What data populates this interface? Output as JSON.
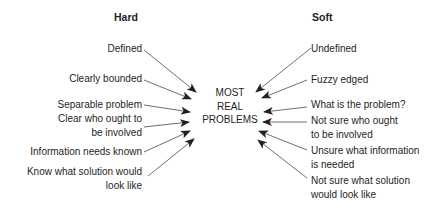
{
  "diagram": {
    "left_heading": "Hard",
    "right_heading": "Soft",
    "center": [
      "MOST",
      "REAL",
      "PROBLEMS"
    ],
    "left_items": [
      [
        "Defined"
      ],
      [
        "Clearly bounded"
      ],
      [
        "Separable problem"
      ],
      [
        "Clear who ought to",
        "be involved"
      ],
      [
        "Information needs known"
      ],
      [
        "Know what solution would",
        "look like"
      ]
    ],
    "right_items": [
      [
        "Undefined"
      ],
      [
        "Fuzzy edged"
      ],
      [
        "What is the problem?"
      ],
      [
        "Not sure who ought",
        "to be involved"
      ],
      [
        "Unsure what information",
        "is needed"
      ],
      [
        "Not sure what solution",
        "would look like"
      ]
    ],
    "arrow_color": "#231f20"
  }
}
